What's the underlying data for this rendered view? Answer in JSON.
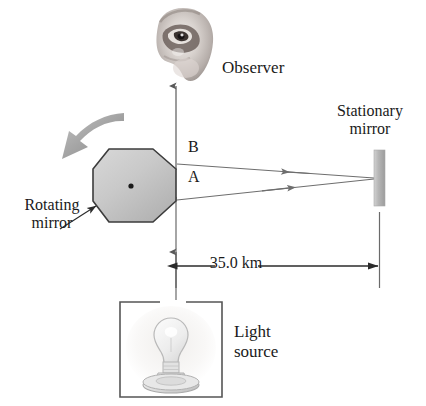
{
  "figure": {
    "background_color": "#ffffff",
    "ink_color": "#1a1a1a"
  },
  "labels": {
    "observer": "Observer",
    "stationary_mirror": "Stationary\nmirror",
    "rotating_mirror": "Rotating\nmirror",
    "light_source": "Light\nsource",
    "ray_a": "A",
    "ray_b": "B"
  },
  "dimension": {
    "value": "35.0 km",
    "from": "rotating-mirror",
    "to": "stationary-mirror"
  },
  "colors": {
    "mirror_fill": "#b4b4b4",
    "octagon_fill": "#c6c6c6",
    "octagon_stroke": "#3c3c3c",
    "ray_stroke": "#6e6e6e",
    "rotation_arrow": "#9a9a9a",
    "box_stroke": "#555555",
    "bulb_stroke": "#b9b9b9"
  },
  "icons": {
    "observer": "eye-icon",
    "light_source": "light-bulb-icon",
    "rotation": "curved-rotation-arrow-icon",
    "stationary_mirror": "mirror-bar-icon",
    "rotating_mirror": "octagon-mirror-icon",
    "pointer": "leader-arrow-icon",
    "dimension": "double-headed-arrow-icon"
  },
  "geometry": {
    "octagon_center": {
      "x": 131,
      "y": 185
    },
    "mirror_rect": {
      "x": 374,
      "y": 150,
      "w": 11,
      "h": 56
    },
    "dimension_y": 266,
    "observer_beam_x": 176
  }
}
